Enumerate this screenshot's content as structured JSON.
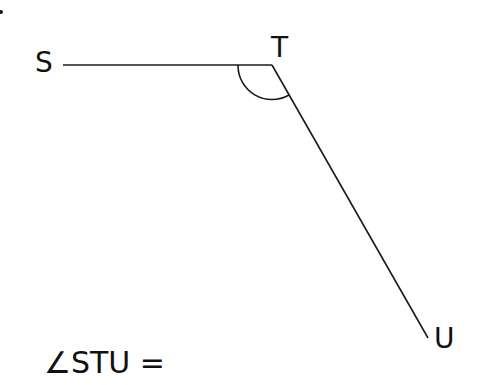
{
  "diagram": {
    "type": "angle",
    "points": {
      "S": {
        "label": "S",
        "x": 63,
        "y": 65
      },
      "T": {
        "label": "T",
        "x": 272,
        "y": 65
      },
      "U": {
        "label": "U",
        "x": 428,
        "y": 338
      }
    },
    "segments": [
      {
        "from": "S",
        "to": "T"
      },
      {
        "from": "T",
        "to": "U"
      }
    ],
    "angle_marker": {
      "vertex": "T",
      "arms": [
        "S",
        "U"
      ],
      "radius": 34
    }
  },
  "labels": {
    "s": "S",
    "t": "T",
    "u": "U"
  },
  "question": {
    "angle_symbol": "∠",
    "angle_name": "STU",
    "equals": " ="
  },
  "colors": {
    "stroke": "#1a1a1a",
    "text": "#111111",
    "background": "#ffffff"
  }
}
